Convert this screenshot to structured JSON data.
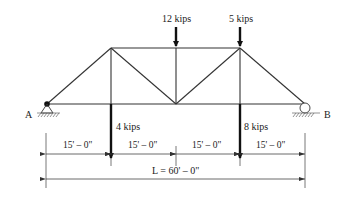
{
  "diagram": {
    "type": "truss",
    "supports": {
      "left": {
        "label": "A",
        "kind": "pin"
      },
      "right": {
        "label": "B",
        "kind": "roller"
      }
    },
    "loads": [
      {
        "label": "12 kips",
        "position": "top",
        "node": "top-middle"
      },
      {
        "label": "5 kips",
        "position": "top",
        "node": "top-right"
      },
      {
        "label": "4 kips",
        "position": "bottom",
        "node": "bottom-1"
      },
      {
        "label": "8 kips",
        "position": "bottom",
        "node": "bottom-3"
      }
    ],
    "panel_dimensions": [
      "15' – 0\"",
      "15' – 0\"",
      "15' – 0\"",
      "15' – 0\""
    ],
    "overall_dimension": "L = 60' – 0\""
  }
}
